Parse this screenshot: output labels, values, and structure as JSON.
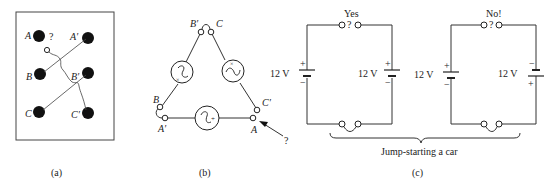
{
  "panel_a": {
    "caption": "(a)",
    "question": "?",
    "terminals": {
      "A": "A",
      "A_prime": "A′",
      "B": "B",
      "B_prime": "B′",
      "C": "C",
      "C_prime": "C′"
    }
  },
  "panel_b": {
    "caption": "(b)",
    "question": "?",
    "terminals": {
      "B_prime": "B′",
      "C": "C",
      "B": "B",
      "C_prime": "C′",
      "A_prime": "A′",
      "A": "A"
    },
    "generator_symbols": {
      "plus": "+",
      "cross": "×"
    }
  },
  "panel_c": {
    "caption": "(c)",
    "brace_label": "Jump-starting a car",
    "circuits": [
      {
        "title": "Yes",
        "question": "?",
        "battery_left": {
          "label": "12 V",
          "top": "+",
          "bottom": "−"
        },
        "battery_right": {
          "label": "12 V",
          "top": "+",
          "bottom": "−"
        }
      },
      {
        "title": "No!",
        "question": "?",
        "battery_left": {
          "label": "12 V",
          "top": "+",
          "bottom": "−"
        },
        "battery_right": {
          "label": "12 V",
          "top": "−",
          "bottom": "+"
        }
      }
    ]
  }
}
